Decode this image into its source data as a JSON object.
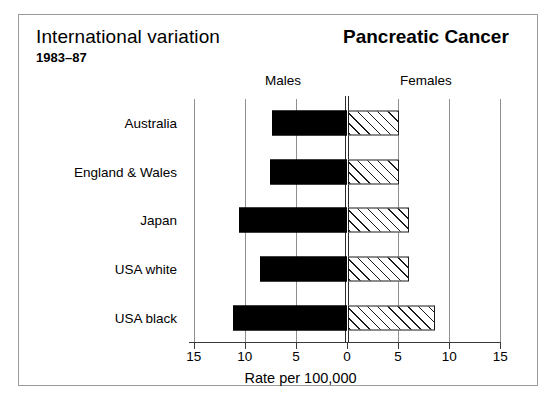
{
  "figure": {
    "title_left": "International variation",
    "subtitle_left": "1983–87",
    "title_right": "Pancreatic Cancer",
    "header_males": "Males",
    "header_females": "Females",
    "axis_caption": "Rate per 100,000"
  },
  "chart_data": {
    "type": "bar",
    "orientation": "horizontal",
    "layout": "population-pyramid",
    "title": "Pancreatic Cancer",
    "subtitle": "International variation 1983–87",
    "xlabel": "Rate per 100,000",
    "ylabel": "",
    "grid": true,
    "legend_position": "top",
    "categories": [
      "Australia",
      "England & Wales",
      "Japan",
      "USA white",
      "USA black"
    ],
    "series": [
      {
        "name": "Males",
        "side": "left",
        "fill": "solid-black",
        "color": "#000000",
        "values": [
          7.3,
          7.5,
          10.6,
          8.5,
          11.2
        ]
      },
      {
        "name": "Females",
        "side": "right",
        "fill": "diagonal-hatch",
        "color": "#ffffff",
        "values": [
          5.0,
          5.0,
          6.0,
          6.0,
          8.5
        ]
      }
    ],
    "axis": {
      "left_max": 15,
      "right_max": 15,
      "tick_values": [
        15,
        10,
        5,
        0,
        5,
        10,
        15
      ],
      "tick_labels": [
        "15",
        "10",
        "5",
        "0",
        "5",
        "10",
        "15"
      ]
    }
  },
  "colors": {
    "frame": "#9a9a9a",
    "gridline": "#8f8f8f",
    "axis": "#3a3a3a",
    "male_bar": "#000000",
    "female_bar": "#ffffff",
    "background": "#ffffff"
  }
}
